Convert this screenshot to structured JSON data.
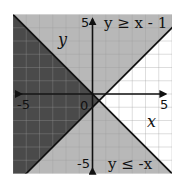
{
  "chart_data": {
    "type": "region",
    "title": "",
    "xlabel": "x",
    "ylabel": "y",
    "xlim": [
      -6,
      6
    ],
    "ylim": [
      -6,
      6
    ],
    "grid": true,
    "tick_labels": {
      "x_neg": "-5",
      "x_pos": "5",
      "y_pos": "5",
      "y_neg": "-5",
      "origin": "0"
    },
    "inequalities": [
      {
        "label": "y ≥ x - 1",
        "line": {
          "slope": 1,
          "intercept": -1
        },
        "shade": "above"
      },
      {
        "label": "y ≤ -x",
        "line": {
          "slope": -1,
          "intercept": 0
        },
        "shade": "below"
      }
    ],
    "colors": {
      "single_shade": "#b8b8b8",
      "overlap_shade": "#4a4a4a",
      "unshaded": "#ffffff",
      "line": "#111111",
      "grid": "#9a9a9a"
    }
  },
  "labels": {
    "ineq1": "y ≥ x - 1",
    "ineq2": "y ≤ -x",
    "x_axis": "x",
    "y_axis": "y",
    "tick_x_neg": "-5",
    "tick_x_pos": "5",
    "tick_y_pos": "5",
    "tick_y_neg": "-5",
    "origin": "0"
  }
}
